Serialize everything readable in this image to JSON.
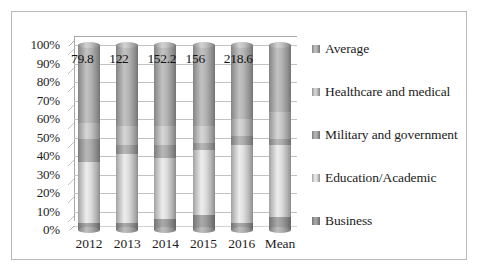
{
  "chart_data": {
    "type": "bar",
    "title": "",
    "subtitle": "",
    "xlabel": "",
    "ylabel": "",
    "stacked": true,
    "normalized_100pct": true,
    "grid": true,
    "legend_position": "right",
    "ylim": [
      0,
      100
    ],
    "categories": [
      "2012",
      "2013",
      "2014",
      "2015",
      "2016",
      "Mean"
    ],
    "ytick_labels": [
      "0%",
      "10%",
      "20%",
      "30%",
      "40%",
      "50%",
      "60%",
      "70%",
      "80%",
      "90%",
      "100%"
    ],
    "ytick_values": [
      0,
      10,
      20,
      30,
      40,
      50,
      60,
      70,
      80,
      90,
      100
    ],
    "series": [
      {
        "name": "Business",
        "color": "#8f8f8f",
        "values": [
          4,
          4,
          6,
          8,
          4,
          7
        ]
      },
      {
        "name": "Education/Academic",
        "color": "#c9c9c9",
        "values": [
          33,
          37,
          33,
          35,
          42,
          39
        ]
      },
      {
        "name": "Military and government",
        "color": "#9b9b9b",
        "values": [
          12,
          5,
          7,
          4,
          5,
          3
        ]
      },
      {
        "name": "Healthcare and medical",
        "color": "#b5b5b5",
        "values": [
          9,
          10,
          10,
          9,
          9,
          15
        ]
      },
      {
        "name": "Average",
        "color": "#a4a4a4",
        "values": [
          42,
          44,
          44,
          44,
          40,
          36
        ]
      }
    ],
    "data_labels": [
      "79.8",
      "122",
      "152.2",
      "156",
      "218.6"
    ],
    "annotations": "Totals printed above the 2012-2016 columns; the Mean column carries no total label."
  },
  "legend": {
    "items": [
      {
        "label": "Average",
        "color": "#a4a4a4"
      },
      {
        "label": "Healthcare and medical",
        "color": "#b5b5b5"
      },
      {
        "label": "Military and government",
        "color": "#9b9b9b"
      },
      {
        "label": "Education/Academic",
        "color": "#c9c9c9"
      },
      {
        "label": "Business",
        "color": "#8f8f8f"
      }
    ]
  },
  "colors": {
    "frame_border": "#b9b9b9",
    "gridline": "#c2c2c2",
    "axis": "#a8a8a8",
    "text": "#1d1d1d",
    "background": "#ffffff"
  }
}
